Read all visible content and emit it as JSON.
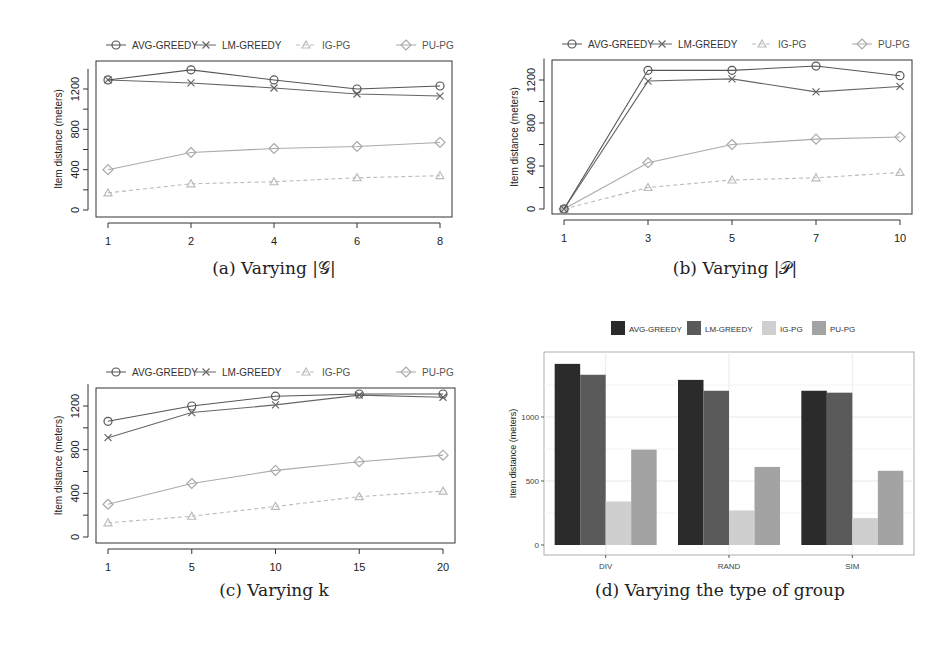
{
  "chart_data": [
    {
      "id": "a",
      "type": "line",
      "title": "",
      "caption": "(a) Varying |𝒢|",
      "xlabel": "",
      "ylabel": "Item distance (meters)",
      "categories": [
        "1",
        "2",
        "4",
        "6",
        "8"
      ],
      "ylim": [
        0,
        1400
      ],
      "yticks": [
        0,
        200,
        400,
        600,
        800,
        1000,
        1200
      ],
      "ytick_labels": [
        "0",
        "",
        "400",
        "",
        "800",
        "",
        "1200"
      ],
      "grid": false,
      "legend_position": "top",
      "series": [
        {
          "name": "AVG-GREEDY",
          "marker": "circle",
          "color": "#555555",
          "dash": "",
          "values": [
            1290,
            1390,
            1290,
            1200,
            1230
          ]
        },
        {
          "name": "LM-GREEDY",
          "marker": "x",
          "color": "#666666",
          "dash": "",
          "values": [
            1290,
            1260,
            1210,
            1150,
            1130
          ]
        },
        {
          "name": "IG-PG",
          "marker": "triangle",
          "color": "#bbbbbb",
          "dash": "4,3",
          "values": [
            170,
            260,
            280,
            320,
            340
          ]
        },
        {
          "name": "PU-PG",
          "marker": "diamond",
          "color": "#aaaaaa",
          "dash": "",
          "values": [
            400,
            570,
            610,
            630,
            670
          ]
        }
      ]
    },
    {
      "id": "b",
      "type": "line",
      "title": "",
      "caption": "(b) Varying |𝒫|",
      "xlabel": "",
      "ylabel": "Item distance (meters)",
      "categories": [
        "1",
        "3",
        "5",
        "7",
        "10"
      ],
      "ylim": [
        0,
        1400
      ],
      "yticks": [
        0,
        200,
        400,
        600,
        800,
        1000,
        1200
      ],
      "ytick_labels": [
        "0",
        "",
        "400",
        "",
        "800",
        "",
        "1200"
      ],
      "grid": false,
      "legend_position": "top",
      "series": [
        {
          "name": "AVG-GREEDY",
          "marker": "circle",
          "color": "#555555",
          "dash": "",
          "values": [
            0,
            1290,
            1290,
            1330,
            1240
          ]
        },
        {
          "name": "LM-GREEDY",
          "marker": "x",
          "color": "#666666",
          "dash": "",
          "values": [
            0,
            1190,
            1210,
            1090,
            1140
          ]
        },
        {
          "name": "IG-PG",
          "marker": "triangle",
          "color": "#bbbbbb",
          "dash": "4,3",
          "values": [
            0,
            200,
            270,
            290,
            340
          ]
        },
        {
          "name": "PU-PG",
          "marker": "diamond",
          "color": "#aaaaaa",
          "dash": "",
          "values": [
            0,
            430,
            600,
            650,
            670
          ]
        }
      ]
    },
    {
      "id": "c",
      "type": "line",
      "title": "",
      "caption": "(c) Varying k",
      "xlabel": "",
      "ylabel": "Item distance (meters)",
      "categories": [
        "1",
        "5",
        "10",
        "15",
        "20"
      ],
      "ylim": [
        0,
        1400
      ],
      "yticks": [
        0,
        200,
        400,
        600,
        800,
        1000,
        1200
      ],
      "ytick_labels": [
        "0",
        "",
        "400",
        "",
        "800",
        "",
        "1200"
      ],
      "grid": false,
      "legend_position": "top",
      "series": [
        {
          "name": "AVG-GREEDY",
          "marker": "circle",
          "color": "#555555",
          "dash": "",
          "values": [
            1060,
            1200,
            1290,
            1310,
            1310
          ]
        },
        {
          "name": "LM-GREEDY",
          "marker": "x",
          "color": "#666666",
          "dash": "",
          "values": [
            910,
            1140,
            1210,
            1300,
            1280
          ]
        },
        {
          "name": "IG-PG",
          "marker": "triangle",
          "color": "#bbbbbb",
          "dash": "4,3",
          "values": [
            130,
            190,
            280,
            370,
            420
          ]
        },
        {
          "name": "PU-PG",
          "marker": "diamond",
          "color": "#aaaaaa",
          "dash": "",
          "values": [
            300,
            490,
            610,
            690,
            750
          ]
        }
      ]
    },
    {
      "id": "d",
      "type": "bar",
      "title": "",
      "caption": "(d) Varying the type of group",
      "xlabel": "",
      "ylabel": "Item distance (meters)",
      "categories": [
        "DIV",
        "RAND",
        "SIM"
      ],
      "ylim": [
        0,
        1500
      ],
      "yticks": [
        0,
        500,
        1000
      ],
      "ytick_labels": [
        "0",
        "500",
        "1000"
      ],
      "grid": true,
      "legend_position": "top",
      "series": [
        {
          "name": "AVG-GREEDY",
          "color": "#2b2b2b",
          "values": [
            1415,
            1290,
            1205
          ]
        },
        {
          "name": "LM-GREEDY",
          "color": "#5a5a5a",
          "values": [
            1330,
            1205,
            1190
          ]
        },
        {
          "name": "IG-PG",
          "color": "#cfcfcf",
          "values": [
            340,
            270,
            210
          ]
        },
        {
          "name": "PU-PG",
          "color": "#a3a3a3",
          "values": [
            745,
            610,
            580
          ]
        }
      ]
    }
  ]
}
